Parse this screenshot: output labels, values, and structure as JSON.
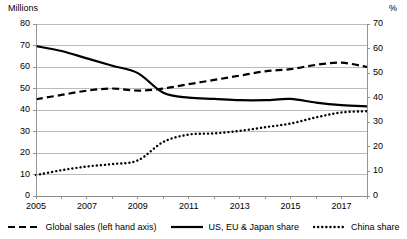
{
  "chart_data": {
    "type": "line",
    "title": "",
    "xlabel": "",
    "ylabel": "Millions",
    "y2label": "%",
    "ylim": [
      0,
      80
    ],
    "y2lim": [
      0,
      70
    ],
    "grid": true,
    "legend_position": "bottom",
    "x": [
      2005,
      2006,
      2007,
      2008,
      2009,
      2010,
      2011,
      2012,
      2013,
      2014,
      2015,
      2016,
      2017,
      2018
    ],
    "xtick_labels": [
      "2005",
      "2007",
      "2009",
      "2011",
      "2013",
      "2015",
      "2017"
    ],
    "xtick_values": [
      2005,
      2007,
      2009,
      2011,
      2013,
      2015,
      2017
    ],
    "ytick_labels_left": [
      "80",
      "70",
      "60",
      "50",
      "40",
      "30",
      "20",
      "10",
      "0"
    ],
    "ytick_values_left": [
      80,
      70,
      60,
      50,
      40,
      30,
      20,
      10,
      0
    ],
    "ytick_labels_right": [
      "70",
      "60",
      "50",
      "40",
      "30",
      "20",
      "10",
      "0"
    ],
    "ytick_values_right": [
      70,
      60,
      50,
      40,
      30,
      20,
      10,
      0
    ],
    "series": [
      {
        "name": "Global sales (left hand axis)",
        "axis": "left",
        "style": "dashed",
        "color": "#000000",
        "values": [
          45,
          47,
          49,
          50,
          49,
          50,
          52,
          54,
          56,
          58,
          59,
          61,
          62,
          60
        ]
      },
      {
        "name": "US, EU & Japan share",
        "axis": "right",
        "style": "solid",
        "color": "#000000",
        "values": [
          61,
          59,
          56,
          53,
          50,
          42,
          40,
          39.5,
          39,
          39,
          39.5,
          38,
          37,
          36.5
        ]
      },
      {
        "name": "China share",
        "axis": "right",
        "style": "dotted",
        "color": "#000000",
        "values": [
          8.5,
          10.5,
          12,
          13,
          14.5,
          22,
          25,
          25.5,
          26.5,
          28,
          29.5,
          32,
          34,
          34.5
        ]
      }
    ]
  },
  "legend": {
    "items": [
      {
        "label": "Global sales (left hand axis)",
        "style": "dashed"
      },
      {
        "label": "US, EU & Japan share",
        "style": "solid"
      },
      {
        "label": "China share",
        "style": "dotted"
      }
    ]
  }
}
